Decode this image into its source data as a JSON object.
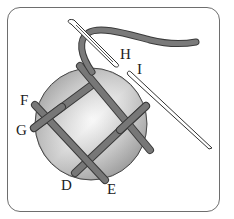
{
  "diagram": {
    "labels": {
      "D": "D",
      "E": "E",
      "F": "F",
      "G": "G",
      "H": "H",
      "I": "I"
    },
    "colors": {
      "border": "#6e6e6e",
      "thread": "#6f6f6f",
      "thread_outline": "#3a3a3a",
      "disc_light": "#f2f2f2",
      "disc_dark": "#8a8a8a"
    }
  }
}
